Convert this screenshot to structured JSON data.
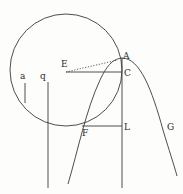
{
  "diagram": {
    "type": "geometric-construction",
    "stroke_color": "#3a3a3a",
    "background": "#fdfdfb",
    "circle": {
      "cx": 66,
      "cy": 70,
      "r": 56
    },
    "points": {
      "A": {
        "label": "A",
        "x": 122,
        "y": 57
      },
      "E": {
        "label": "E",
        "x": 66,
        "y": 72
      },
      "C": {
        "label": "C",
        "x": 122,
        "y": 72
      },
      "F": {
        "label": "F",
        "x": 82,
        "y": 126
      },
      "L": {
        "label": "L",
        "x": 122,
        "y": 126
      },
      "G": {
        "label": "G",
        "x": 168,
        "y": 126
      }
    },
    "segments": {
      "a_label": "a",
      "q_label": "q"
    },
    "labels": {
      "A": "A",
      "E": "E",
      "C": "C",
      "F": "F",
      "L": "L",
      "G": "G",
      "a": "a",
      "q": "q"
    }
  }
}
